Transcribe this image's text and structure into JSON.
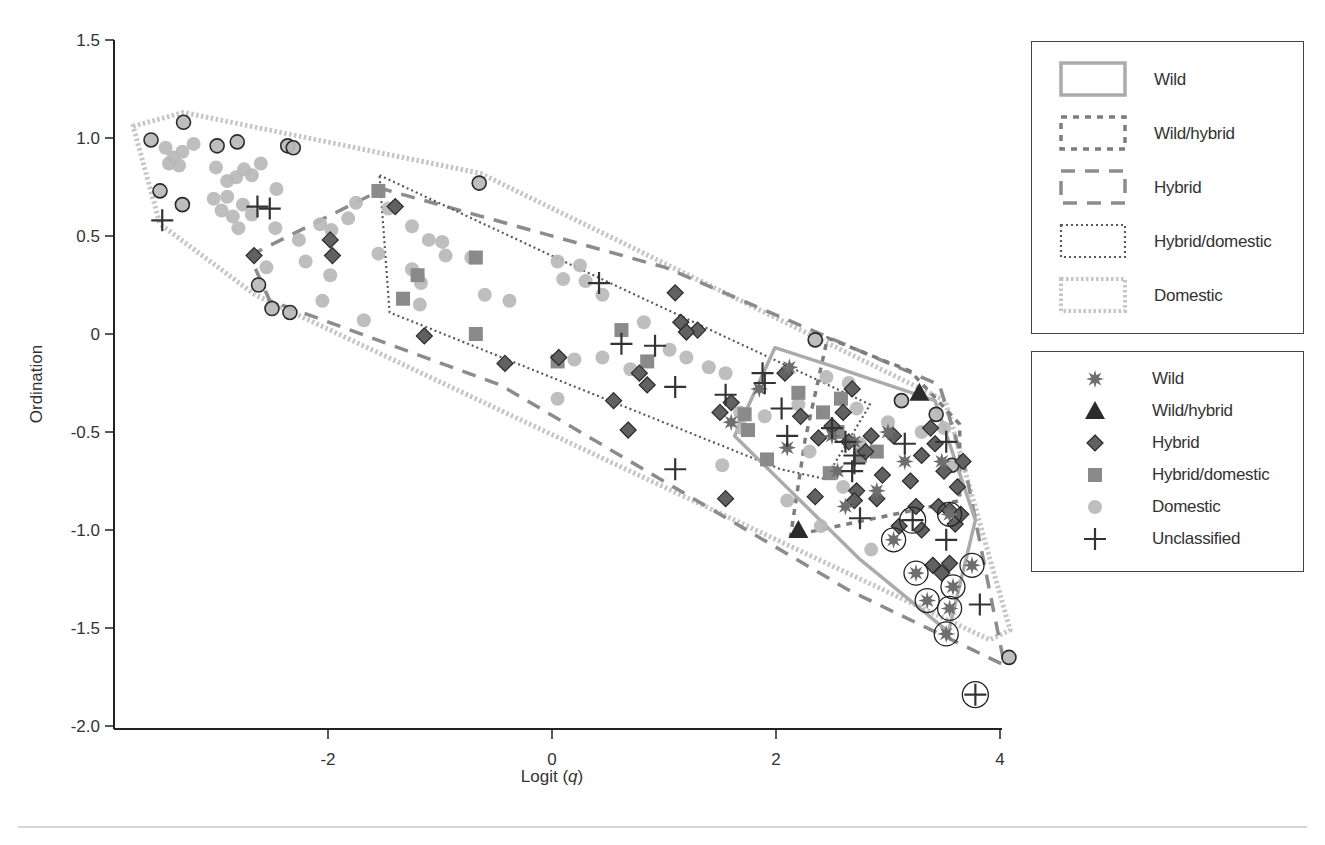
{
  "chart_data": {
    "type": "scatter",
    "title": "",
    "xlabel": "Logit (q)",
    "xlabel_parts": {
      "prefix": "Logit (",
      "italic": "q",
      "suffix": ")"
    },
    "ylabel": "Ordination",
    "xlim": [
      -3.9,
      4.0
    ],
    "ylim": [
      -2.0,
      1.5
    ],
    "x_ticks": [
      -2,
      0,
      2,
      4
    ],
    "x_tick_labels": [
      "-2",
      "0",
      "2",
      "4"
    ],
    "y_ticks": [
      1.5,
      1.0,
      0.5,
      0,
      -0.5,
      -1.0,
      -1.5,
      -2.0
    ],
    "y_tick_labels": [
      "1.5",
      "1.0",
      "0.5",
      "0",
      "-0.5",
      "-1.0",
      "-1.5",
      "-2.0"
    ],
    "grid": false,
    "legend_position": "right",
    "hull_legend": [
      {
        "label": "Wild",
        "style": "solid",
        "color": "#a9a9a9"
      },
      {
        "label": "Wild/hybrid",
        "style": "short-dash",
        "color": "#7a7a7a"
      },
      {
        "label": "Hybrid",
        "style": "long-dash",
        "color": "#8a8a8a"
      },
      {
        "label": "Hybrid/domestic",
        "style": "fine-dot",
        "color": "#555555"
      },
      {
        "label": "Domestic",
        "style": "thick-dot",
        "color": "#c4c4c4"
      }
    ],
    "marker_legend": [
      {
        "label": "Wild",
        "marker": "star",
        "color": "#6e6e6e"
      },
      {
        "label": "Wild/hybrid",
        "marker": "triangle",
        "color": "#2b2b2b"
      },
      {
        "label": "Hybrid",
        "marker": "diamond",
        "color": "#5f5f5f"
      },
      {
        "label": "Hybrid/domestic",
        "marker": "square",
        "color": "#8a8a8a"
      },
      {
        "label": "Domestic",
        "marker": "circle",
        "color": "#b8b8b8"
      },
      {
        "label": "Unclassified",
        "marker": "plus",
        "color": "#333333"
      }
    ],
    "hulls": [
      {
        "name": "Domestic",
        "points": [
          [
            -3.74,
            1.06
          ],
          [
            -3.29,
            1.13
          ],
          [
            -0.64,
            0.82
          ],
          [
            3.51,
            -0.34
          ],
          [
            4.09,
            -1.51
          ],
          [
            3.91,
            -1.56
          ],
          [
            -0.46,
            -0.39
          ],
          [
            -2.65,
            0.2
          ],
          [
            -3.5,
            0.56
          ]
        ]
      },
      {
        "name": "Hybrid",
        "points": [
          [
            -2.7,
            0.4
          ],
          [
            -1.51,
            0.74
          ],
          [
            1.01,
            0.34
          ],
          [
            3.46,
            -0.26
          ],
          [
            3.69,
            -0.69
          ],
          [
            4.04,
            -1.69
          ],
          [
            2.66,
            -1.31
          ],
          [
            -0.46,
            -0.26
          ],
          [
            -2.52,
            0.17
          ]
        ]
      },
      {
        "name": "Hybrid/domestic",
        "points": [
          [
            -1.54,
            0.81
          ],
          [
            2.84,
            -0.36
          ],
          [
            2.44,
            -0.74
          ],
          [
            2.04,
            -0.69
          ],
          [
            -1.45,
            0.11
          ]
        ]
      },
      {
        "name": "Wild/hybrid",
        "points": [
          [
            2.46,
            -0.02
          ],
          [
            3.2,
            -0.19
          ],
          [
            3.64,
            -0.46
          ],
          [
            3.64,
            -0.85
          ],
          [
            2.13,
            -1.03
          ],
          [
            2.26,
            -0.54
          ]
        ]
      },
      {
        "name": "Wild",
        "points": [
          [
            1.99,
            -0.07
          ],
          [
            2.48,
            -0.16
          ],
          [
            3.42,
            -0.34
          ],
          [
            3.78,
            -0.95
          ],
          [
            3.54,
            -1.52
          ],
          [
            2.75,
            -1.15
          ],
          [
            1.63,
            -0.52
          ]
        ]
      }
    ],
    "series": [
      {
        "name": "Domestic",
        "marker": "circle",
        "points": [
          [
            -3.58,
            0.99,
            1
          ],
          [
            -3.29,
            1.08,
            1
          ],
          [
            -3.5,
            0.73,
            1
          ],
          [
            -3.3,
            0.66,
            1
          ],
          [
            -2.99,
            0.96,
            1
          ],
          [
            -2.81,
            0.98,
            1
          ],
          [
            -2.36,
            0.96,
            1
          ],
          [
            -2.31,
            0.95,
            1
          ],
          [
            -2.62,
            0.25,
            1
          ],
          [
            -2.5,
            0.13,
            1
          ],
          [
            -2.34,
            0.11,
            1
          ],
          [
            -0.65,
            0.77,
            1
          ],
          [
            2.35,
            -0.03,
            1
          ],
          [
            3.12,
            -0.34,
            1
          ],
          [
            3.43,
            -0.41,
            1
          ],
          [
            3.57,
            -0.67,
            1
          ],
          [
            4.08,
            -1.65,
            1
          ],
          [
            -3.45,
            0.95,
            0
          ],
          [
            -3.38,
            0.9,
            0
          ],
          [
            -3.3,
            0.93,
            0
          ],
          [
            -3.42,
            0.87,
            0
          ],
          [
            -3.33,
            0.86,
            0
          ],
          [
            -3.2,
            0.97,
            0
          ],
          [
            -3.0,
            0.85,
            0
          ],
          [
            -2.9,
            0.78,
            0
          ],
          [
            -2.82,
            0.8,
            0
          ],
          [
            -2.75,
            0.84,
            0
          ],
          [
            -2.68,
            0.81,
            0
          ],
          [
            -2.6,
            0.87,
            0
          ],
          [
            -2.9,
            0.7,
            0
          ],
          [
            -3.02,
            0.69,
            0
          ],
          [
            -2.95,
            0.63,
            0
          ],
          [
            -2.85,
            0.6,
            0
          ],
          [
            -2.76,
            0.66,
            0
          ],
          [
            -2.68,
            0.61,
            0
          ],
          [
            -2.8,
            0.54,
            0
          ],
          [
            -2.46,
            0.74,
            0
          ],
          [
            -2.47,
            0.54,
            0
          ],
          [
            -2.55,
            0.34,
            0
          ],
          [
            -2.26,
            0.48,
            0
          ],
          [
            -2.07,
            0.56,
            0
          ],
          [
            -2.2,
            0.37,
            0
          ],
          [
            -1.98,
            0.3,
            0
          ],
          [
            -2.05,
            0.17,
            0
          ],
          [
            -1.75,
            0.67,
            0
          ],
          [
            -1.82,
            0.59,
            0
          ],
          [
            -1.97,
            0.53,
            0
          ],
          [
            -1.68,
            0.07,
            0
          ],
          [
            -1.46,
            0.64,
            0
          ],
          [
            -1.55,
            0.41,
            0
          ],
          [
            -1.25,
            0.55,
            0
          ],
          [
            -1.17,
            0.26,
            0
          ],
          [
            -1.25,
            0.33,
            0
          ],
          [
            -1.1,
            0.48,
            0
          ],
          [
            -1.18,
            0.15,
            0
          ],
          [
            -0.98,
            0.47,
            0
          ],
          [
            -0.95,
            0.4,
            0
          ],
          [
            -0.72,
            0.39,
            0
          ],
          [
            -0.6,
            0.2,
            0
          ],
          [
            -0.38,
            0.17,
            0
          ],
          [
            0.05,
            0.37,
            0
          ],
          [
            0.1,
            0.28,
            0
          ],
          [
            0.25,
            0.35,
            0
          ],
          [
            0.3,
            0.27,
            0
          ],
          [
            0.45,
            0.2,
            0
          ],
          [
            0.05,
            -0.33,
            0
          ],
          [
            0.2,
            -0.13,
            0
          ],
          [
            0.45,
            -0.12,
            0
          ],
          [
            0.7,
            -0.18,
            0
          ],
          [
            0.82,
            0.06,
            0
          ],
          [
            1.05,
            -0.08,
            0
          ],
          [
            1.2,
            -0.12,
            0
          ],
          [
            1.4,
            -0.17,
            0
          ],
          [
            1.55,
            -0.2,
            0
          ],
          [
            1.68,
            -0.4,
            0
          ],
          [
            1.9,
            -0.42,
            0
          ],
          [
            1.52,
            -0.67,
            0
          ],
          [
            1.7,
            -0.48,
            0
          ],
          [
            2.2,
            -0.36,
            0
          ],
          [
            2.45,
            -0.22,
            0
          ],
          [
            2.65,
            -0.25,
            0
          ],
          [
            2.72,
            -0.38,
            0
          ],
          [
            2.3,
            -0.6,
            0
          ],
          [
            2.6,
            -0.78,
            0
          ],
          [
            2.75,
            -0.56,
            0
          ],
          [
            3.0,
            -0.45,
            0
          ],
          [
            3.3,
            -0.5,
            0
          ],
          [
            3.5,
            -0.48,
            0
          ],
          [
            2.85,
            -1.1,
            0
          ],
          [
            2.1,
            -0.85,
            0
          ],
          [
            2.4,
            -0.98,
            0
          ]
        ]
      },
      {
        "name": "Hybrid/domestic",
        "marker": "square",
        "points": [
          [
            -1.55,
            0.73
          ],
          [
            -1.33,
            0.18
          ],
          [
            -1.2,
            0.3
          ],
          [
            -0.68,
            0.39
          ],
          [
            -0.68,
            0.0
          ],
          [
            0.05,
            -0.14
          ],
          [
            0.62,
            0.02
          ],
          [
            0.85,
            -0.14
          ],
          [
            1.72,
            -0.41
          ],
          [
            2.2,
            -0.3
          ],
          [
            1.75,
            -0.49
          ],
          [
            2.42,
            -0.4
          ],
          [
            1.92,
            -0.64
          ],
          [
            2.48,
            -0.71
          ],
          [
            2.58,
            -0.33
          ],
          [
            2.9,
            -0.6
          ],
          [
            2.55,
            -0.5
          ],
          [
            2.75,
            -0.62
          ]
        ]
      },
      {
        "name": "Hybrid",
        "marker": "diamond",
        "points": [
          [
            -2.66,
            0.4
          ],
          [
            -1.4,
            0.65
          ],
          [
            -1.98,
            0.48
          ],
          [
            -1.96,
            0.4
          ],
          [
            -1.14,
            -0.01
          ],
          [
            -0.42,
            -0.15
          ],
          [
            0.06,
            -0.12
          ],
          [
            0.55,
            -0.34
          ],
          [
            0.68,
            -0.49
          ],
          [
            0.78,
            -0.2
          ],
          [
            0.85,
            -0.26
          ],
          [
            1.1,
            0.21
          ],
          [
            1.15,
            0.06
          ],
          [
            1.3,
            0.02
          ],
          [
            1.2,
            0.01
          ],
          [
            1.5,
            -0.4
          ],
          [
            1.55,
            -0.84
          ],
          [
            1.6,
            -0.35
          ],
          [
            2.08,
            -0.2
          ],
          [
            2.22,
            -0.42
          ],
          [
            2.35,
            -0.83
          ],
          [
            2.38,
            -0.53
          ],
          [
            2.5,
            -0.47
          ],
          [
            2.6,
            -0.4
          ],
          [
            2.68,
            -0.28
          ],
          [
            2.65,
            -0.55
          ],
          [
            2.72,
            -0.8
          ],
          [
            2.8,
            -0.6
          ],
          [
            2.85,
            -0.52
          ],
          [
            2.95,
            -0.72
          ],
          [
            3.05,
            -0.52
          ],
          [
            3.2,
            -0.75
          ],
          [
            3.25,
            -0.88
          ],
          [
            3.3,
            -0.62
          ],
          [
            3.38,
            -0.48
          ],
          [
            3.42,
            -0.56
          ],
          [
            3.45,
            -0.88
          ],
          [
            3.5,
            -0.7
          ],
          [
            3.55,
            -0.9
          ],
          [
            3.6,
            -0.97
          ],
          [
            3.62,
            -0.78
          ],
          [
            3.65,
            -0.92
          ],
          [
            3.67,
            -0.65
          ],
          [
            3.4,
            -1.18
          ],
          [
            3.48,
            -1.22
          ],
          [
            3.55,
            -1.17
          ],
          [
            3.3,
            -1.0
          ],
          [
            2.7,
            -0.85
          ],
          [
            2.9,
            -0.84
          ],
          [
            3.1,
            -0.98
          ]
        ]
      },
      {
        "name": "Wild/hybrid",
        "marker": "triangle",
        "points": [
          [
            3.28,
            -0.3
          ],
          [
            2.2,
            -1.0
          ]
        ]
      },
      {
        "name": "Wild",
        "marker": "star",
        "points": [
          [
            2.12,
            -0.17
          ],
          [
            1.85,
            -0.28
          ],
          [
            2.1,
            -0.58
          ],
          [
            1.6,
            -0.45
          ],
          [
            2.5,
            -0.52
          ],
          [
            2.7,
            -0.55
          ],
          [
            2.55,
            -0.7
          ],
          [
            2.9,
            -0.8
          ],
          [
            3.0,
            -0.5
          ],
          [
            3.15,
            -0.65
          ],
          [
            3.48,
            -0.65
          ],
          [
            3.05,
            -1.05,
            1
          ],
          [
            3.25,
            -1.22,
            1
          ],
          [
            3.35,
            -1.36,
            1
          ],
          [
            3.55,
            -1.4,
            1
          ],
          [
            3.58,
            -1.29,
            1
          ],
          [
            3.75,
            -1.18,
            1
          ],
          [
            3.52,
            -1.53,
            1
          ],
          [
            3.55,
            -0.92,
            1
          ],
          [
            2.62,
            -0.88
          ]
        ]
      },
      {
        "name": "Unclassified",
        "marker": "plus",
        "points": [
          [
            -3.48,
            0.58
          ],
          [
            -2.63,
            0.65
          ],
          [
            -2.52,
            0.64
          ],
          [
            0.42,
            0.26
          ],
          [
            0.62,
            -0.05
          ],
          [
            0.92,
            -0.06
          ],
          [
            1.1,
            -0.27
          ],
          [
            1.55,
            -0.31
          ],
          [
            1.1,
            -0.69
          ],
          [
            1.88,
            -0.2
          ],
          [
            2.05,
            -0.38
          ],
          [
            2.1,
            -0.52
          ],
          [
            2.5,
            -0.48
          ],
          [
            2.62,
            -0.55
          ],
          [
            2.7,
            -0.62
          ],
          [
            2.7,
            -0.66
          ],
          [
            2.68,
            -0.7
          ],
          [
            2.75,
            -0.94
          ],
          [
            3.15,
            -0.56
          ],
          [
            3.22,
            -0.95,
            1
          ],
          [
            3.52,
            -1.05
          ],
          [
            3.52,
            -0.55
          ],
          [
            3.82,
            -1.38
          ],
          [
            3.78,
            -1.84,
            1
          ],
          [
            1.9,
            -0.25
          ]
        ]
      }
    ]
  }
}
